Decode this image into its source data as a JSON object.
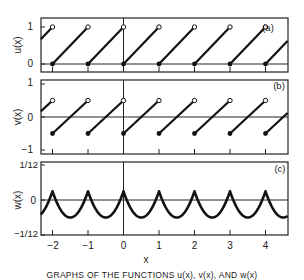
{
  "figure": {
    "caption": "GRAPHS OF THE FUNCTIONS u(x), v(x), AND w(x)",
    "xlabel": "x"
  },
  "chart_data": [
    {
      "type": "line",
      "panel": "(a)",
      "ylabel": "u(x)",
      "title": "",
      "function": "u(x) = x - floor(x) (sawtooth, fractional part)",
      "xlim": [
        -2.33,
        4.62
      ],
      "ylim": [
        -0.2,
        1.25
      ],
      "yticks": [
        {
          "value": 0,
          "label": "0"
        },
        {
          "value": 1,
          "label": "1"
        }
      ],
      "xticks": [
        -2,
        -1,
        0,
        1,
        2,
        3,
        4
      ],
      "xtick_labels": [
        "−2",
        "−1",
        "0",
        "1",
        "2",
        "3",
        "4"
      ],
      "segments": [
        {
          "x": [
            -2.33,
            -2
          ],
          "y": [
            0.67,
            1
          ],
          "end": "open"
        },
        {
          "x": [
            -2,
            -1
          ],
          "y": [
            0,
            1
          ],
          "start": "filled",
          "end": "open"
        },
        {
          "x": [
            -1,
            0
          ],
          "y": [
            0,
            1
          ],
          "start": "filled",
          "end": "open"
        },
        {
          "x": [
            0,
            1
          ],
          "y": [
            0,
            1
          ],
          "start": "filled",
          "end": "open"
        },
        {
          "x": [
            1,
            2
          ],
          "y": [
            0,
            1
          ],
          "start": "filled",
          "end": "open"
        },
        {
          "x": [
            2,
            3
          ],
          "y": [
            0,
            1
          ],
          "start": "filled",
          "end": "open"
        },
        {
          "x": [
            3,
            4
          ],
          "y": [
            0,
            1
          ],
          "start": "filled",
          "end": "open"
        },
        {
          "x": [
            4,
            4.62
          ],
          "y": [
            0,
            0.62
          ],
          "start": "filled"
        }
      ],
      "zero_line": true,
      "grid": false
    },
    {
      "type": "line",
      "panel": "(b)",
      "ylabel": "v(x)",
      "title": "",
      "function": "v(x) = x - floor(x) - 1/2",
      "xlim": [
        -2.33,
        4.62
      ],
      "ylim": [
        -1.1,
        1.05
      ],
      "yticks": [
        {
          "value": 1,
          "label": "1"
        },
        {
          "value": 0,
          "label": "0"
        },
        {
          "value": -1,
          "label": "−1"
        }
      ],
      "xticks": [
        -2,
        -1,
        0,
        1,
        2,
        3,
        4
      ],
      "segments": [
        {
          "x": [
            -2.33,
            -2
          ],
          "y": [
            0.17,
            0.5
          ],
          "end": "open"
        },
        {
          "x": [
            -2,
            -1
          ],
          "y": [
            -0.5,
            0.5
          ],
          "start": "filled",
          "end": "open"
        },
        {
          "x": [
            -1,
            0
          ],
          "y": [
            -0.5,
            0.5
          ],
          "start": "filled",
          "end": "open"
        },
        {
          "x": [
            0,
            1
          ],
          "y": [
            -0.5,
            0.5
          ],
          "start": "filled",
          "end": "open"
        },
        {
          "x": [
            1,
            2
          ],
          "y": [
            -0.5,
            0.5
          ],
          "start": "filled",
          "end": "open"
        },
        {
          "x": [
            2,
            3
          ],
          "y": [
            -0.5,
            0.5
          ],
          "start": "filled",
          "end": "open"
        },
        {
          "x": [
            3,
            4
          ],
          "y": [
            -0.5,
            0.5
          ],
          "start": "filled",
          "end": "open"
        },
        {
          "x": [
            4,
            4.62
          ],
          "y": [
            -0.5,
            0.12
          ],
          "start": "filled"
        }
      ],
      "zero_line": true,
      "grid": false
    },
    {
      "type": "line",
      "panel": "(c)",
      "ylabel": "w(x)",
      "title": "",
      "function": "w(x) = (v(x)^2)/2 - 1/24 scaled; cusp maxima 1/12 at integers, minima at half-integers",
      "xlim": [
        -2.33,
        4.62
      ],
      "ylim": [
        -0.0875,
        0.0875
      ],
      "yticks": [
        {
          "value": 0.0833,
          "label": "1/12"
        },
        {
          "value": 0,
          "label": "0"
        },
        {
          "value": -0.0833,
          "label": "−1/12"
        }
      ],
      "xticks": [
        -2,
        -1,
        0,
        1,
        2,
        3,
        4
      ],
      "peaks": {
        "x": [
          -2,
          -1,
          0,
          1,
          2,
          3,
          4
        ],
        "y": 0.0833
      },
      "troughs": {
        "x": [
          -1.5,
          -0.5,
          0.5,
          1.5,
          2.5,
          3.5,
          4.5
        ],
        "y": -0.0417
      },
      "zero_line": true,
      "grid": false
    }
  ],
  "layout": {
    "plot_left": 41,
    "plot_right": 288,
    "x_origin_px": 123.5,
    "px_per_unit": 35.5,
    "panels": [
      {
        "top": 18,
        "bottom": 72,
        "y_zero": 64,
        "y_one": 27
      },
      {
        "top": 80,
        "bottom": 154,
        "y_zero": 117,
        "y_one": 149
      },
      {
        "top": 162,
        "bottom": 235,
        "y_zero": 200,
        "y_unit": 35
      }
    ],
    "colors": {
      "line": "#111111",
      "frame": "#222222",
      "background": "#ffffff"
    }
  }
}
